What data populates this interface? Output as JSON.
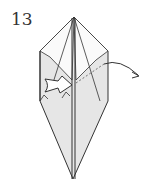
{
  "step": {
    "number": "13"
  },
  "diagram": {
    "colors": {
      "paper": "#e8e8e8",
      "line": "#333333",
      "background": "#ffffff"
    }
  }
}
